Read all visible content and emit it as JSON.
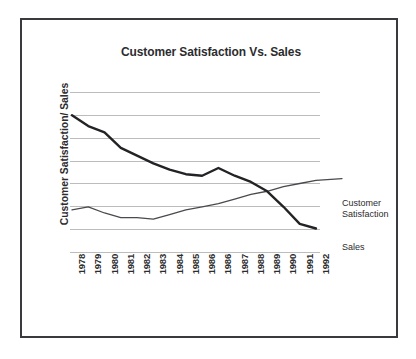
{
  "figure": {
    "title": "Customer Satisfaction Vs. Sales",
    "y_axis_title": "Customer Satisfaction/ Sales",
    "border_color": "#3a3a3e",
    "background_color": "#ffffff"
  },
  "labels": {
    "satisfaction_line1": "Customer",
    "satisfaction_line2": "Satisfaction",
    "sales": "Sales"
  },
  "chart_data": {
    "type": "line",
    "title": "Customer Satisfaction Vs. Sales",
    "xlabel": "",
    "ylabel": "Customer Satisfaction/ Sales",
    "grid": true,
    "gridlines": 8,
    "legend_position": "right-inline",
    "axis_tick_labels_shown": false,
    "ylim": [
      0,
      100
    ],
    "categories": [
      "1978",
      "1979",
      "1980",
      "1981",
      "1982",
      "1983",
      "1984",
      "1985",
      "1986",
      "1986",
      "1987",
      "1988",
      "1989",
      "1990",
      "1991",
      "1992"
    ],
    "series": [
      {
        "name": "Sales",
        "color": "#232326",
        "line_width": "thick",
        "values": [
          92,
          85,
          81,
          71,
          66,
          61,
          57,
          54,
          53,
          58,
          53,
          49,
          43,
          33,
          22,
          19
        ]
      },
      {
        "name": "Customer Satisfaction",
        "color": "#4a4a4e",
        "line_width": "thin",
        "values": [
          31,
          33,
          29,
          26,
          26,
          25,
          28,
          31,
          33,
          35,
          38,
          41,
          43,
          46,
          48,
          50
        ]
      }
    ]
  }
}
